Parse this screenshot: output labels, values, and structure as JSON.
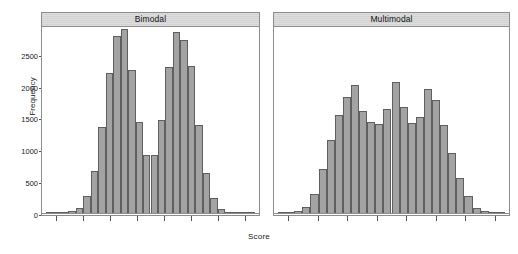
{
  "chart_data": {
    "type": "bar",
    "title": "",
    "xlabel": "Score",
    "ylabel": "Frequency",
    "ylim": [
      0,
      2950
    ],
    "yticks": [
      0,
      500,
      1000,
      1500,
      2000,
      2500
    ],
    "ytick_labels": [
      "0",
      "500",
      "1000",
      "1500",
      "2000",
      "2500"
    ],
    "grid": false,
    "legend": false,
    "layout": "two panels side by side (lattice trellis), shared y axis, x ticks unlabeled",
    "panels": [
      {
        "label": "Bimodal",
        "n_xticks": 8,
        "bin_values": [
          10,
          15,
          25,
          40,
          90,
          285,
          675,
          1370,
          2215,
          2800,
          2900,
          2260,
          1450,
          920,
          930,
          1480,
          2310,
          2860,
          2730,
          2315,
          1390,
          640,
          255,
          85,
          30,
          20,
          12,
          8
        ]
      },
      {
        "label": "Multimodal",
        "n_xticks": 8,
        "bin_values": [
          15,
          25,
          45,
          110,
          310,
          700,
          1160,
          1560,
          1830,
          2030,
          1610,
          1440,
          1420,
          1650,
          2070,
          1680,
          1430,
          1530,
          1960,
          1790,
          1400,
          960,
          560,
          290,
          95,
          40,
          22,
          12
        ]
      }
    ]
  }
}
